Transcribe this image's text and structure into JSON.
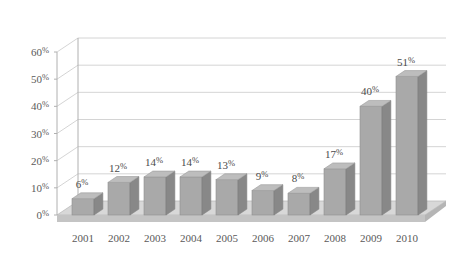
{
  "chart_data": {
    "type": "bar",
    "title": "",
    "subtitle": "",
    "xlabel": "",
    "ylabel": "",
    "categories": [
      "2001",
      "2002",
      "2003",
      "2004",
      "2005",
      "2006",
      "2007",
      "2008",
      "2009",
      "2010"
    ],
    "values": [
      6,
      12,
      14,
      14,
      13,
      9,
      8,
      17,
      40,
      51
    ],
    "value_labels": [
      "6%",
      "12%",
      "14%",
      "14%",
      "13%",
      "9%",
      "8%",
      "17%",
      "40%",
      "51%"
    ],
    "ylim": [
      0,
      60
    ],
    "ytick_values": [
      0,
      10,
      20,
      30,
      40,
      50,
      60
    ],
    "ytick_labels": [
      "0%",
      "10%",
      "20%",
      "30%",
      "40%",
      "50%",
      "60%"
    ],
    "grid": true,
    "legend": "none",
    "style": "3d-column",
    "units": "percent"
  },
  "colors": {
    "background": "#ffffff",
    "bar_front": "#a9a9a9",
    "bar_side": "#888888",
    "bar_top": "#bdbdbd",
    "floor": "#c4c4c4",
    "floor_top": "#d8d8d8",
    "gridline": "#c9c9c9",
    "axis": "#b0b0b0",
    "tick_text": "#5a5a5a",
    "value_text": "#4a4a4a"
  }
}
